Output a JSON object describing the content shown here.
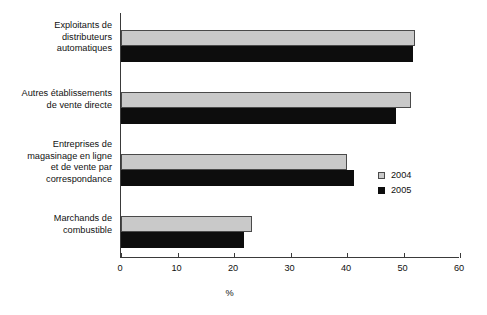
{
  "chart_data": {
    "type": "bar",
    "orientation": "horizontal",
    "title": "",
    "subtitle": "",
    "xlabel": "%",
    "ylabel": "",
    "xlim": [
      0,
      60
    ],
    "xticks": [
      0,
      10,
      20,
      30,
      40,
      50,
      60
    ],
    "xtick_labels": [
      "0",
      "10",
      "20",
      "30",
      "40",
      "50",
      "60"
    ],
    "grid": false,
    "legend_position": "center-right",
    "categories": [
      "Exploitants de distributeurs automatiques",
      "Autres établissements de vente directe",
      "Entreprises de magasinage en ligne et de vente par correspondance",
      "Marchands de combustible"
    ],
    "category_lines": [
      [
        "Exploitants de",
        "distributeurs",
        "automatiques"
      ],
      [
        "Autres établissements",
        "de vente directe"
      ],
      [
        "Entreprises de",
        "magasinage en ligne",
        "et de vente par",
        "correspondance"
      ],
      [
        "Marchands de",
        "combustible"
      ]
    ],
    "series": [
      {
        "name": "2004",
        "color": "#c9c9c9",
        "values": [
          52.0,
          51.3,
          40.0,
          23.2
        ]
      },
      {
        "name": "2005",
        "color": "#0d0d0d",
        "values": [
          51.7,
          48.7,
          41.2,
          21.8
        ]
      }
    ]
  },
  "legend": {
    "items": [
      {
        "label": "2004",
        "color": "#c9c9c9"
      },
      {
        "label": "2005",
        "color": "#0d0d0d"
      }
    ]
  },
  "axis": {
    "x_title": "%"
  }
}
